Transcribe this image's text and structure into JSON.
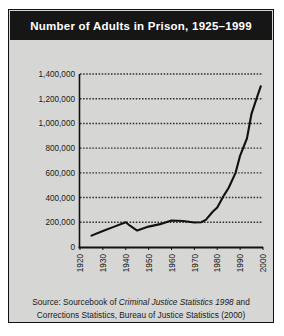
{
  "figure": {
    "title": "Number of Adults in Prison, 1925–1999",
    "source_prefix": "Source: Sourcebook of ",
    "source_italic": "Criminal Justice Statistics 1998",
    "source_middle": " and",
    "source_line2": "Corrections Statistics, Bureau of Justice Statistics (2000)",
    "background_color": "#d6d6d4",
    "banner_color": "#161616",
    "banner_text_color": "#ffffff",
    "border_color": "#111111",
    "line_color": "#111111",
    "gridline_color": "#2b2b2b"
  },
  "chart_data": {
    "type": "line",
    "title": "Number of Adults in Prison, 1925–1999",
    "xlabel": "",
    "ylabel": "",
    "xlim": [
      1920,
      2000
    ],
    "ylim": [
      0,
      1400000
    ],
    "grid": true,
    "legend": false,
    "xtick_labels": [
      "1920",
      "1930",
      "1940",
      "1950",
      "1960",
      "1970",
      "1980",
      "1990",
      "2000"
    ],
    "xticks": [
      1920,
      1930,
      1940,
      1950,
      1960,
      1970,
      1980,
      1990,
      2000
    ],
    "ytick_labels": [
      "0",
      "200,000",
      "400,000",
      "600,000",
      "800,000",
      "1,000,000",
      "1,200,000",
      "1,400,000"
    ],
    "yticks": [
      0,
      200000,
      400000,
      600000,
      800000,
      1000000,
      1200000,
      1400000
    ],
    "series": [
      {
        "name": "Adults in prison",
        "x": [
          1925,
          1930,
          1935,
          1940,
          1942,
          1945,
          1950,
          1955,
          1960,
          1965,
          1970,
          1973,
          1975,
          1978,
          1980,
          1983,
          1985,
          1988,
          1990,
          1993,
          1995,
          1997,
          1999
        ],
        "values": [
          92000,
          130000,
          165000,
          200000,
          170000,
          133000,
          165000,
          185000,
          215000,
          210000,
          198000,
          200000,
          220000,
          285000,
          320000,
          420000,
          480000,
          600000,
          740000,
          880000,
          1080000,
          1190000,
          1300000
        ]
      }
    ]
  }
}
